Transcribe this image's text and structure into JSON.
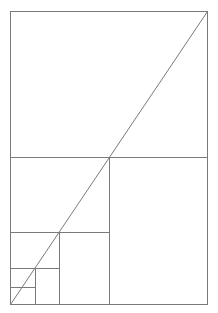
{
  "diagram": {
    "title": "",
    "stroke_color": "#7a7a7a",
    "stroke_width": 1,
    "background": "#ffffff",
    "outer_rect": {
      "x1": 10,
      "y1": 11,
      "x2": 207,
      "y2": 304
    },
    "lines": [
      {
        "name": "divider-h-1",
        "x1": 10,
        "y1": 157,
        "x2": 207,
        "y2": 157
      },
      {
        "name": "divider-v-1",
        "x1": 109,
        "y1": 157,
        "x2": 109,
        "y2": 304
      },
      {
        "name": "divider-h-2",
        "x1": 10,
        "y1": 232,
        "x2": 109,
        "y2": 232
      },
      {
        "name": "divider-v-2",
        "x1": 59,
        "y1": 232,
        "x2": 59,
        "y2": 304
      },
      {
        "name": "divider-h-3",
        "x1": 10,
        "y1": 268,
        "x2": 59,
        "y2": 268
      },
      {
        "name": "divider-v-3",
        "x1": 35,
        "y1": 268,
        "x2": 35,
        "y2": 304
      },
      {
        "name": "divider-h-4",
        "x1": 10,
        "y1": 287,
        "x2": 35,
        "y2": 287
      }
    ],
    "diagonal": {
      "x1": 10,
      "y1": 304,
      "x2": 207,
      "y2": 11
    }
  }
}
